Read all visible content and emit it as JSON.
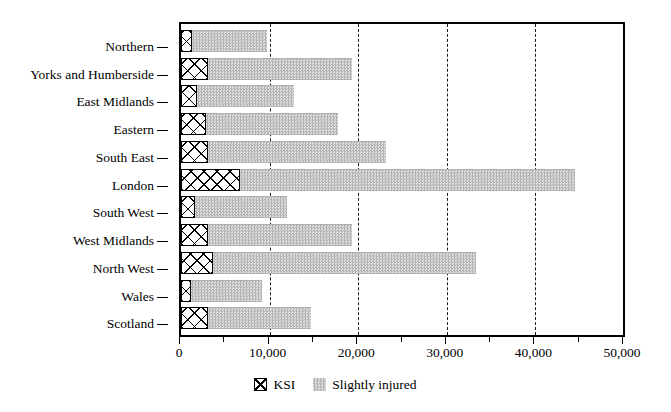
{
  "chart_data": {
    "type": "bar",
    "orientation": "horizontal",
    "stacked": true,
    "title": "",
    "subtitle": "",
    "xlabel": "",
    "ylabel": "",
    "xlim": [
      0,
      50000
    ],
    "ylim": null,
    "grid": "vertical-dashed-at-major-ticks",
    "legend_position": "bottom-center",
    "categories": [
      "Northern",
      "Yorks and Humberside",
      "East Midlands",
      "Eastern",
      "South East",
      "London",
      "South West",
      "West Midlands",
      "North West",
      "Wales",
      "Scotland"
    ],
    "series": [
      {
        "name": "KSI",
        "pattern": "crosshatch",
        "color": "#ffffff",
        "values": [
          1200,
          3000,
          1800,
          2800,
          3100,
          6700,
          1600,
          3000,
          3600,
          1100,
          3000
        ]
      },
      {
        "name": "Slightly injured",
        "pattern": "dotted-gray",
        "color": "#c9c9c9",
        "values": [
          8500,
          16300,
          11000,
          14900,
          20000,
          37800,
          10400,
          16300,
          29700,
          8000,
          11700
        ]
      }
    ],
    "totals": [
      9700,
      19300,
      12800,
      17700,
      23100,
      44500,
      12000,
      19300,
      33300,
      9100,
      14700
    ],
    "x_ticks_major": [
      0,
      10000,
      20000,
      30000,
      40000,
      50000
    ],
    "x_ticks_major_labels": [
      "0",
      "10,000",
      "20,000",
      "30,000",
      "40,000",
      "50,000"
    ],
    "x_ticks_minor": [
      5000,
      15000,
      25000,
      35000,
      45000
    ],
    "gridlines_at": [
      10000,
      20000,
      30000,
      40000
    ]
  },
  "legend": {
    "items": [
      {
        "label": "KSI",
        "swatch": "crosshatch-swatch"
      },
      {
        "label": "Slightly injured",
        "swatch": "gray-dotted-swatch"
      }
    ]
  }
}
